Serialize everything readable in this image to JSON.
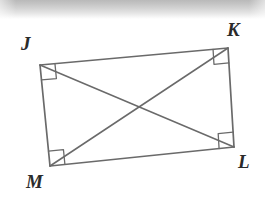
{
  "figure": {
    "kind": "geometry-diagram",
    "shape_name": "quadrilateral JKLM",
    "background_color": "#ffffff",
    "stroke_color": "#6a6a6a",
    "label_color": "#2b2b2b",
    "vertices": [
      {
        "id": "J",
        "label": "J",
        "x": 40,
        "y": 65,
        "right_angle": true
      },
      {
        "id": "K",
        "label": "K",
        "x": 228,
        "y": 48,
        "right_angle": true
      },
      {
        "id": "L",
        "label": "L",
        "x": 234,
        "y": 147,
        "right_angle": true
      },
      {
        "id": "M",
        "label": "M",
        "x": 50,
        "y": 166,
        "right_angle": true
      }
    ],
    "sides": [
      {
        "id": "JK",
        "from": "J",
        "to": "K"
      },
      {
        "id": "KL",
        "from": "K",
        "to": "L"
      },
      {
        "id": "LM",
        "from": "L",
        "to": "M"
      },
      {
        "id": "MJ",
        "from": "M",
        "to": "J"
      }
    ],
    "diagonals": [
      {
        "id": "JL",
        "from": "J",
        "to": "L"
      },
      {
        "id": "KM",
        "from": "K",
        "to": "M"
      }
    ],
    "diagonal_intersection": {
      "x": 135,
      "y": 108
    },
    "right_angle_marker_size": 15
  },
  "labels": {
    "J": "J",
    "K": "K",
    "L": "L",
    "M": "M"
  }
}
